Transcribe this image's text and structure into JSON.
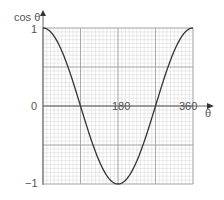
{
  "chart_data": {
    "type": "line",
    "title": "",
    "xlabel": "θ",
    "ylabel": "cos θ",
    "x_ticks": [
      "180",
      "360"
    ],
    "y_ticks": [
      "1",
      "0",
      "−1"
    ],
    "xlim": [
      0,
      360
    ],
    "ylim": [
      -1,
      1
    ],
    "grid": true,
    "legend": null,
    "series": [
      {
        "name": "cos θ",
        "x": [
          0,
          30,
          60,
          90,
          120,
          150,
          180,
          210,
          240,
          270,
          300,
          330,
          360
        ],
        "values": [
          1,
          0.866,
          0.5,
          0,
          -0.5,
          -0.866,
          -1,
          -0.866,
          -0.5,
          0,
          0.5,
          0.866,
          1
        ]
      }
    ]
  },
  "labels": {
    "y_axis": "cos θ",
    "x_axis": "θ",
    "y_top": "1",
    "y_zero": "0",
    "y_bottom": "−1",
    "x_mid": "180",
    "x_end": "360"
  }
}
